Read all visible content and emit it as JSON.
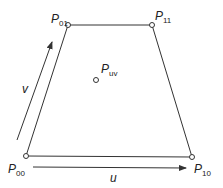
{
  "diagram": {
    "type": "bilinear-patch",
    "colors": {
      "line": "#333333",
      "point_fill": "#ffffff",
      "text": "#222222"
    },
    "points": [
      {
        "id": "P00",
        "label": "P",
        "subscript": "00",
        "x": 26,
        "y": 156
      },
      {
        "id": "P10",
        "label": "P",
        "subscript": "10",
        "x": 192,
        "y": 157
      },
      {
        "id": "P01",
        "label": "P",
        "subscript": "01",
        "x": 68,
        "y": 25
      },
      {
        "id": "P11",
        "label": "P",
        "subscript": "11",
        "x": 152,
        "y": 25
      },
      {
        "id": "Puv",
        "label": "P",
        "subscript": "uv",
        "x": 96,
        "y": 80
      }
    ],
    "edges": [
      [
        "P00",
        "P10"
      ],
      [
        "P10",
        "P11"
      ],
      [
        "P11",
        "P01"
      ],
      [
        "P01",
        "P00"
      ]
    ],
    "arrows": [
      {
        "id": "u",
        "label": "u",
        "from": [
          33,
          167
        ],
        "to": [
          186,
          168
        ]
      },
      {
        "id": "v",
        "label": "v",
        "from": [
          17,
          140
        ],
        "to": [
          52,
          42
        ]
      }
    ]
  }
}
